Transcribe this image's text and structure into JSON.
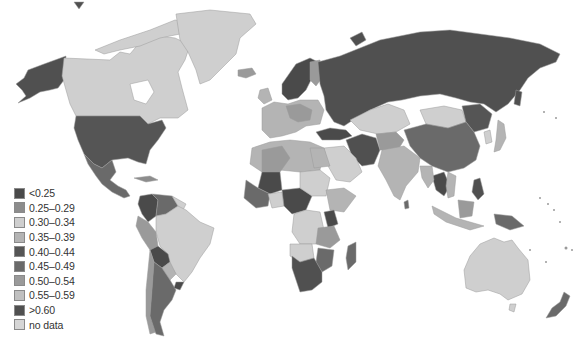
{
  "map": {
    "type": "choropleth",
    "projection": "world",
    "color_scheme": "grayscale",
    "background": "#ffffff",
    "regions": [
      {
        "name": "Alaska (USA)",
        "class": ">0.60"
      },
      {
        "name": "Canada",
        "class": "0.30-0.34"
      },
      {
        "name": "Greenland",
        "class": "0.30-0.34"
      },
      {
        "name": "Iceland",
        "class": "0.50-0.54"
      },
      {
        "name": "USA",
        "class": "0.40-0.44"
      },
      {
        "name": "Mexico",
        "class": "0.45-0.49"
      },
      {
        "name": "Central America",
        "class": "0.45-0.49"
      },
      {
        "name": "Colombia",
        "class": "<0.25"
      },
      {
        "name": "Venezuela",
        "class": "0.45-0.49"
      },
      {
        "name": "Brazil",
        "class": "0.30-0.34"
      },
      {
        "name": "Peru",
        "class": "0.50-0.54"
      },
      {
        "name": "Bolivia",
        "class": "<0.25"
      },
      {
        "name": "Argentina",
        "class": "0.45-0.49"
      },
      {
        "name": "Chile",
        "class": "0.50-0.54"
      },
      {
        "name": "Paraguay",
        "class": "0.35-0.39"
      },
      {
        "name": "Uruguay",
        "class": "<0.25"
      },
      {
        "name": "Norway",
        "class": "<0.25"
      },
      {
        "name": "Sweden",
        "class": "<0.25"
      },
      {
        "name": "Finland",
        "class": "0.50-0.54"
      },
      {
        "name": "Russia",
        "class": ">0.60"
      },
      {
        "name": "Western Europe",
        "class": "0.35-0.39"
      },
      {
        "name": "Central Europe",
        "class": "0.50-0.54"
      },
      {
        "name": "Turkey",
        "class": "<0.25"
      },
      {
        "name": "Iran",
        "class": ">0.60"
      },
      {
        "name": "Kazakhstan",
        "class": "0.30-0.34"
      },
      {
        "name": "Mongolia",
        "class": "0.30-0.34"
      },
      {
        "name": "China",
        "class": "0.45-0.49"
      },
      {
        "name": "NE China",
        "class": "0.40-0.44"
      },
      {
        "name": "Japan",
        "class": "0.35-0.39"
      },
      {
        "name": "Korea",
        "class": "0.30-0.34"
      },
      {
        "name": "India",
        "class": "0.35-0.39"
      },
      {
        "name": "Saudi Arabia",
        "class": "0.30-0.34"
      },
      {
        "name": "North Africa",
        "class": "0.35-0.39"
      },
      {
        "name": "Algeria",
        "class": "0.50-0.54"
      },
      {
        "name": "Mali",
        "class": "<0.25"
      },
      {
        "name": "Nigeria/Central",
        "class": "<0.25"
      },
      {
        "name": "Ethiopia",
        "class": "0.35-0.39"
      },
      {
        "name": "Kenya",
        "class": "<0.25"
      },
      {
        "name": "Tanzania",
        "class": "0.50-0.54"
      },
      {
        "name": "DR Congo",
        "class": "0.30-0.34"
      },
      {
        "name": "Angola",
        "class": "0.30-0.34"
      },
      {
        "name": "Southern Africa",
        "class": ">0.60"
      },
      {
        "name": "Madagascar",
        "class": "0.45-0.49"
      },
      {
        "name": "Thailand",
        "class": "<0.25"
      },
      {
        "name": "Philippines",
        "class": ">0.60"
      },
      {
        "name": "Indonesia",
        "class": "0.35-0.39"
      },
      {
        "name": "Borneo (Malaysia)",
        "class": "0.50-0.54"
      },
      {
        "name": "Papua New Guinea",
        "class": "0.45-0.49"
      },
      {
        "name": "Australia",
        "class": "0.30-0.34"
      },
      {
        "name": "New Zealand",
        "class": "0.45-0.49"
      }
    ]
  },
  "legend": {
    "items": [
      {
        "label": "<0.25",
        "color": "#4a4a4a"
      },
      {
        "label": "0.25–0.29",
        "color": "#8c8c8c"
      },
      {
        "label": "0.30–0.34",
        "color": "#cfcfcf"
      },
      {
        "label": "0.35–0.39",
        "color": "#b4b4b4"
      },
      {
        "label": "0.40–0.44",
        "color": "#555555"
      },
      {
        "label": "0.45–0.49",
        "color": "#6a6a6a"
      },
      {
        "label": "0.50–0.54",
        "color": "#9a9a9a"
      },
      {
        "label": "0.55–0.59",
        "color": "#c0c0c0"
      },
      {
        "label": ">0.60",
        "color": "#505050"
      },
      {
        "label": "no data",
        "color": "#d6d6d6"
      }
    ]
  }
}
